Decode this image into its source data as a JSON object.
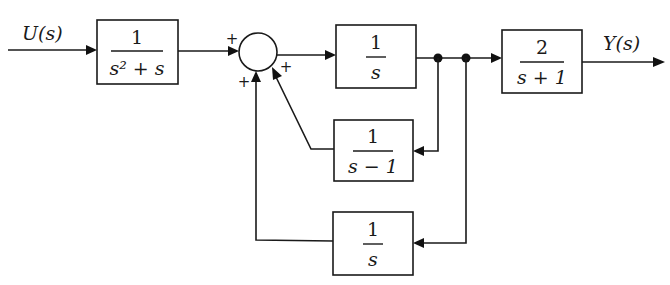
{
  "signals": {
    "input": "U(s)",
    "output": "Y(s)"
  },
  "blocks": [
    {
      "id": "G1",
      "numerator": "1",
      "denominator": "s² + s"
    },
    {
      "id": "G2",
      "numerator": "1",
      "denominator": "s"
    },
    {
      "id": "G3",
      "numerator": "2",
      "denominator": "s + 1"
    },
    {
      "id": "H1",
      "numerator": "1",
      "denominator": "s − 1"
    },
    {
      "id": "H2",
      "numerator": "1",
      "denominator": "s"
    }
  ],
  "summing_junction": {
    "signs": {
      "left": "+",
      "bottom": "+",
      "lower_right": "+"
    }
  },
  "colors": {
    "line": "#1a1a1a",
    "background": "#ffffff"
  }
}
